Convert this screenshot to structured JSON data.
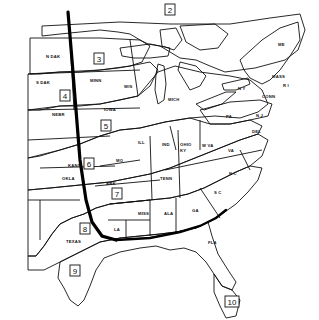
{
  "map": {
    "title": "",
    "zones": [
      {
        "id": "1",
        "label": ""
      },
      {
        "id": "2",
        "label": "2"
      },
      {
        "id": "3",
        "label": "3"
      },
      {
        "id": "4",
        "label": "4"
      },
      {
        "id": "5",
        "label": "5"
      },
      {
        "id": "6",
        "label": "6"
      },
      {
        "id": "7",
        "label": "7"
      },
      {
        "id": "8",
        "label": "8"
      },
      {
        "id": "9",
        "label": "9"
      },
      {
        "id": "10",
        "label": "10"
      }
    ],
    "states": {
      "ndak": "N DAK",
      "sdak": "S DAK",
      "minn": "MINN",
      "wis": "WIS",
      "nebr": "NEBR",
      "iowa": "IOWA",
      "ill": "ILL",
      "mich": "MICH",
      "ind": "IND",
      "ohio": "OHIO",
      "pa": "PA",
      "ny": "N Y",
      "me": "ME",
      "mass": "MASS",
      "conn": "CONN",
      "ri": "R I",
      "nj": "N J",
      "del": "DEL",
      "wva": "W VA",
      "va": "VA",
      "ky": "KY",
      "kans": "KANS",
      "mo": "MO",
      "okla": "OKLA",
      "ark": "ARK",
      "tenn": "TENN",
      "nc": "N C",
      "sc": "S C",
      "ga": "GA",
      "ala": "ALA",
      "miss": "MISS",
      "la": "LA",
      "texas": "TEXAS",
      "fla": "FLA"
    },
    "colors": {
      "ink": "#111111",
      "paper": "#ffffff",
      "light_gray": "#d4d4d4",
      "mid_gray": "#a8a8a8",
      "dark_gray": "#555555"
    }
  }
}
